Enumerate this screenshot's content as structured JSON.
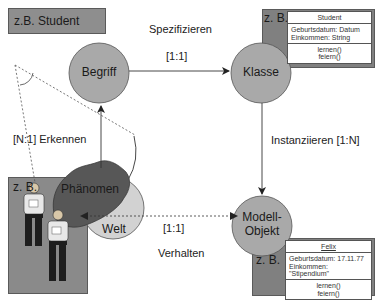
{
  "diagram": {
    "example_label": "z.B. Student",
    "nodes": {
      "begriff": "Begriff",
      "klasse": "Klasse",
      "modell_objekt_line1": "Modell-",
      "modell_objekt_line2": "Objekt",
      "phaenomen": "Phänomen",
      "welt": "Welt"
    },
    "edges": {
      "spezifizieren": "Spezifizieren",
      "spezifizieren_card": "[1:1]",
      "instanziieren": "Instanziieren [1:N]",
      "erkennen": "[N:1] Erkennen",
      "verhalten_card": "[1:1]",
      "verhalten": "Verhalten"
    },
    "class_example": {
      "zb": "z. B.",
      "name": "Student",
      "attr1": "Geburtsdatum: Datum",
      "attr2": "Einkommen: String",
      "op1": "lernen()",
      "op2": "feiern()"
    },
    "object_example": {
      "zb": "z. B.",
      "name": "Felix",
      "attr1": "Geburtsdatum: 17.11.77",
      "attr2": "Einkommen: \"Stipendium\"",
      "op1": "lernen()",
      "op2": "feiern()"
    },
    "phenomenon_example": {
      "zb": "z. B."
    },
    "colors": {
      "circle_fill": "#a8a8a8",
      "phaenomen_fill": "#555555",
      "welt_fill": "#d0d0d0",
      "zb_box": "#8a8a8a"
    }
  }
}
